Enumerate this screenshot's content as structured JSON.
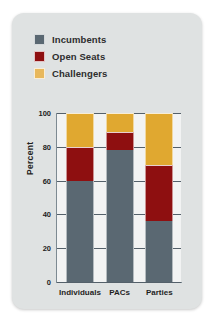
{
  "card": {
    "background_color": "#dfe2e2",
    "plot_background_color": "#f2f3f3"
  },
  "legend": {
    "position": "top-left",
    "items": [
      {
        "label": "Incumbents",
        "color": "#5a6872",
        "icon": "square-swatch-icon"
      },
      {
        "label": "Open Seats",
        "color": "#8e0f10",
        "icon": "square-swatch-icon"
      },
      {
        "label": "Challengers",
        "color": "#e8b85c",
        "icon": "square-swatch-icon"
      }
    ]
  },
  "axes": {
    "ylabel": "Percent",
    "yticks": [
      0,
      20,
      40,
      60,
      80,
      100
    ],
    "ymin": 0,
    "ymax": 100,
    "grid": true,
    "xlabel": ""
  },
  "chart_data": {
    "type": "bar",
    "title": "",
    "subtitle": "",
    "xlabel": "",
    "ylabel": "Percent",
    "ylim": [
      0,
      100
    ],
    "yticks": [
      0,
      20,
      40,
      60,
      80,
      100
    ],
    "grid": true,
    "stacked": true,
    "legend_position": "top-left",
    "categories": [
      "Individuals",
      "PACs",
      "Parties"
    ],
    "series": [
      {
        "name": "Incumbents",
        "color": "#5a6872",
        "values": [
          60,
          78,
          36
        ]
      },
      {
        "name": "Open Seats",
        "color": "#8e0f10",
        "values": [
          20,
          11,
          33
        ]
      },
      {
        "name": "Challengers",
        "color": "#e0a830",
        "values": [
          20,
          11,
          31
        ]
      }
    ],
    "annotations": []
  }
}
